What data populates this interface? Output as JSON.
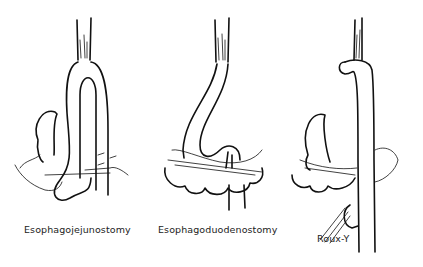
{
  "figure": {
    "panels": [
      {
        "id": "esophagojejunostomy",
        "label": "Esophagojejunostomy"
      },
      {
        "id": "esophagoduodenostomy",
        "label": "Esophagoduodenostomy"
      },
      {
        "id": "roux-y",
        "label": "Roux-Y"
      }
    ]
  }
}
